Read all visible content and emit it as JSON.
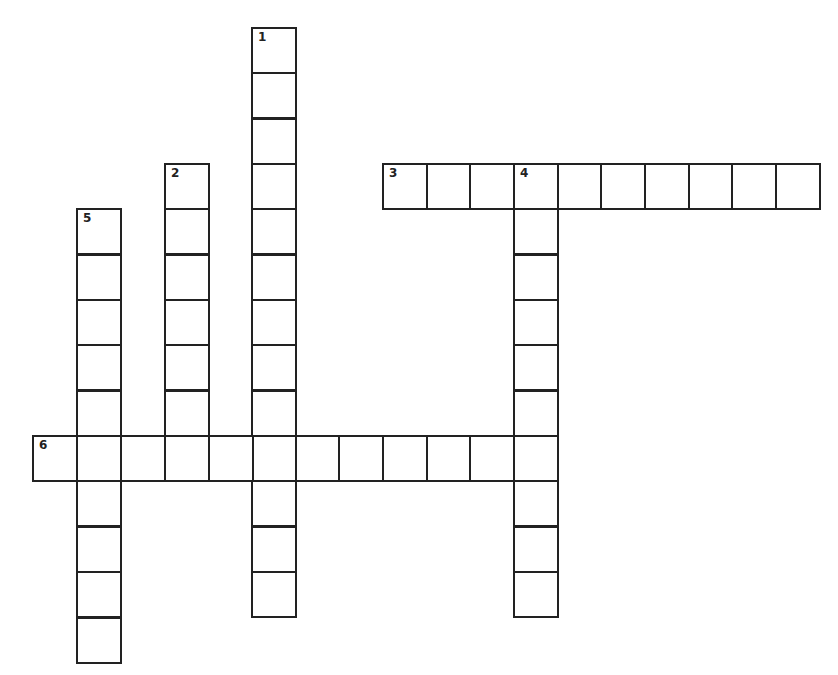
{
  "puzzle": {
    "type": "crossword",
    "colors": {
      "line": "#222222",
      "cell": "#ffffff",
      "background": "#ffffff"
    },
    "grid": {
      "col_x": [
        32,
        76,
        120,
        164,
        208,
        251,
        295,
        338,
        382,
        426,
        469,
        513,
        557,
        600,
        644,
        688,
        731,
        775
      ],
      "row_y": [
        27,
        72,
        118,
        163,
        208,
        254,
        299,
        344,
        390,
        435,
        480,
        526,
        571,
        617
      ],
      "cell_size": 44
    },
    "entries": [
      {
        "number": "1",
        "direction": "down",
        "col": 5,
        "row": 0,
        "length": 13
      },
      {
        "number": "2",
        "direction": "down",
        "col": 3,
        "row": 3,
        "length": 7
      },
      {
        "number": "3",
        "direction": "across",
        "col": 8,
        "row": 3,
        "length": 10
      },
      {
        "number": "4",
        "direction": "down",
        "col": 11,
        "row": 3,
        "length": 10
      },
      {
        "number": "5",
        "direction": "down",
        "col": 1,
        "row": 4,
        "length": 10
      },
      {
        "number": "6",
        "direction": "across",
        "col": 0,
        "row": 9,
        "length": 12
      }
    ]
  }
}
